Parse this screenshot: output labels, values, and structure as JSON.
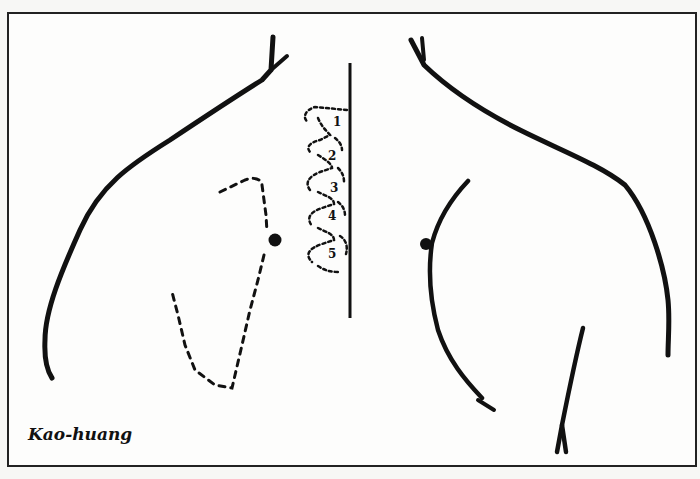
{
  "figure": {
    "caption": "Kao-huang",
    "colors": {
      "ink": "#111111",
      "paper": "#f7f7f5",
      "frame": "#222222"
    },
    "vertebrae_labels": [
      "1",
      "2",
      "3",
      "4",
      "5"
    ],
    "elements": [
      {
        "name": "left-shoulder-outline",
        "style": "solid"
      },
      {
        "name": "right-shoulder-outline",
        "style": "solid"
      },
      {
        "name": "spine-midline",
        "style": "solid"
      },
      {
        "name": "vertebrae-outline",
        "style": "dotted"
      },
      {
        "name": "scapula-outline-left",
        "style": "dashed"
      },
      {
        "name": "scapula-outline-right",
        "style": "solid"
      },
      {
        "name": "acupoint-left",
        "style": "filled-dot"
      },
      {
        "name": "acupoint-right",
        "style": "filled-dot"
      },
      {
        "name": "arm-line-right",
        "style": "solid"
      }
    ]
  }
}
